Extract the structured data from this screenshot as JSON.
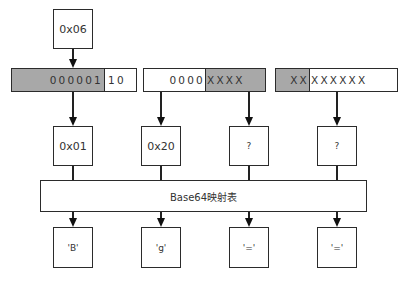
{
  "diagram": {
    "input_byte": "0x06",
    "bit_groups": [
      {
        "gray_text": "000001",
        "white_text": "10",
        "gray_side": "left"
      },
      {
        "white_text": "0000",
        "gray_text": "XXXX",
        "gray_side": "right"
      },
      {
        "gray_text": "XX",
        "white_text": "XXXXXX",
        "gray_side": "left"
      }
    ],
    "indices": [
      "0x01",
      "0x20",
      "?",
      "?"
    ],
    "mapping_table_label": "Base64映射表",
    "outputs": [
      "'B'",
      "'g'",
      "'='",
      "'='"
    ],
    "colors": {
      "border": "#2b2b2b",
      "gray_fill": "#a8a8a8",
      "background": "#ffffff"
    }
  }
}
